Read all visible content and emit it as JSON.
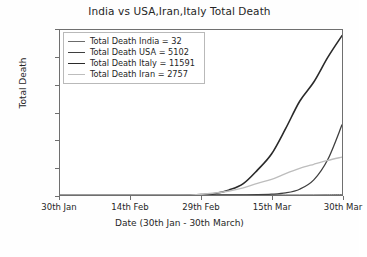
{
  "chart_data": {
    "type": "line",
    "title": "India vs USA,Iran,Italy Total Death",
    "xlabel": "Date (30th Jan - 30th March)",
    "ylabel": "Total Death",
    "xlim": [
      0,
      60
    ],
    "ylim": [
      0,
      12000
    ],
    "grid": false,
    "legend_position": "upper left",
    "xtick_labels": [
      "30th Jan",
      "14th Feb",
      "29th Feb",
      "15th Mar",
      "30th Mar"
    ],
    "xtick_values": [
      0,
      15,
      30,
      45,
      60
    ],
    "ytick_labels": [
      "0",
      "2000",
      "4000",
      "6000",
      "8000",
      "10000",
      "12000"
    ],
    "ytick_values": [
      0,
      2000,
      4000,
      6000,
      8000,
      10000,
      12000
    ],
    "x": [
      0,
      3,
      6,
      9,
      12,
      15,
      18,
      21,
      24,
      27,
      30,
      33,
      36,
      39,
      42,
      45,
      48,
      51,
      54,
      57,
      60
    ],
    "series": [
      {
        "name": "Total Death India",
        "final_value": 32,
        "color": "#6b6b6b",
        "linewidth": 1.0,
        "values": [
          0,
          0,
          0,
          0,
          0,
          0,
          0,
          0,
          0,
          0,
          1,
          1,
          1,
          2,
          2,
          3,
          4,
          7,
          10,
          20,
          32
        ]
      },
      {
        "name": "Total Death USA",
        "final_value": 5102,
        "color": "#3f3f3f",
        "linewidth": 1.3,
        "values": [
          0,
          0,
          0,
          0,
          0,
          0,
          0,
          0,
          0,
          0,
          0,
          1,
          6,
          12,
          22,
          57,
          150,
          420,
          1100,
          2600,
          5102
        ]
      },
      {
        "name": "Total Death Italy",
        "final_value": 11591,
        "color": "#2a2a2a",
        "linewidth": 1.6,
        "values": [
          0,
          0,
          0,
          0,
          0,
          0,
          0,
          0,
          2,
          10,
          29,
          107,
          366,
          827,
          1809,
          2978,
          4825,
          6820,
          8215,
          10023,
          11591
        ]
      },
      {
        "name": "Total Death Iran",
        "final_value": 2757,
        "color": "#bdbdbd",
        "linewidth": 1.3,
        "values": [
          0,
          0,
          0,
          0,
          0,
          0,
          0,
          0,
          0,
          12,
          43,
          145,
          291,
          514,
          853,
          1135,
          1556,
          1934,
          2234,
          2517,
          2757
        ]
      }
    ],
    "legend_entries": [
      "Total Death India = 32",
      "Total Death USA = 5102",
      "Total Death Italy = 11591",
      "Total Death Iran = 2757"
    ]
  }
}
